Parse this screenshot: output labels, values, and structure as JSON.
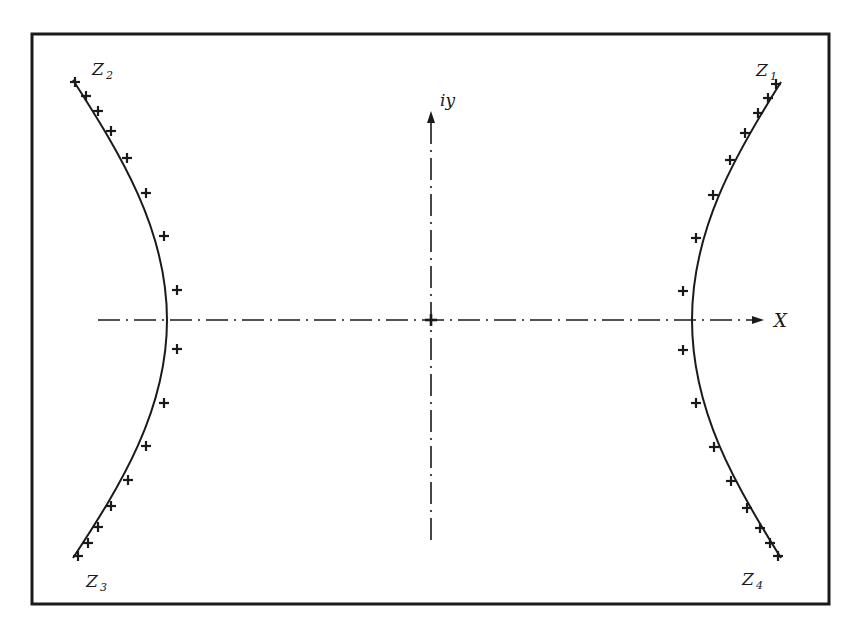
{
  "diagram": {
    "type": "hyperbola-root-locus",
    "frame": {
      "x": 31,
      "y": 33,
      "width": 798,
      "height": 571
    },
    "colors": {
      "ink": "#1a1a1a",
      "background": "#ffffff"
    },
    "axes": {
      "origin": {
        "x": 431,
        "y": 320
      },
      "x_axis": {
        "label": "X",
        "from": 98,
        "to": 764,
        "style": "dash-dot",
        "arrow": true
      },
      "y_axis": {
        "label": "iy",
        "from": 540,
        "to": 112,
        "style": "dash-dot",
        "arrow": true
      },
      "origin_marker": "+"
    },
    "branches": [
      {
        "name": "right",
        "vertex_x": 692,
        "top_label": "Z",
        "top_sub": "1",
        "bottom_label": "Z",
        "bottom_sub": "4"
      },
      {
        "name": "left",
        "vertex_x": 167,
        "top_label": "Z",
        "top_sub": "2",
        "bottom_label": "Z",
        "bottom_sub": "3"
      }
    ],
    "labels": {
      "z1": {
        "main": "Z",
        "sub": "1"
      },
      "z2": {
        "main": "Z",
        "sub": "2"
      },
      "z3": {
        "main": "Z",
        "sub": "3"
      },
      "z4": {
        "main": "Z",
        "sub": "4"
      },
      "x_axis": "X",
      "y_axis": "iy"
    },
    "markers": {
      "symbol": "+",
      "left": [
        [
          75,
          82
        ],
        [
          86,
          96
        ],
        [
          98,
          111
        ],
        [
          111,
          131
        ],
        [
          127,
          158
        ],
        [
          146,
          193
        ],
        [
          164,
          236
        ],
        [
          177,
          290
        ],
        [
          177,
          349
        ],
        [
          164,
          403
        ],
        [
          146,
          446
        ],
        [
          128,
          480
        ],
        [
          111,
          506
        ],
        [
          98,
          527
        ],
        [
          88,
          543
        ],
        [
          78,
          556
        ]
      ],
      "right": [
        [
          776,
          84
        ],
        [
          768,
          98
        ],
        [
          758,
          113
        ],
        [
          745,
          133
        ],
        [
          730,
          160
        ],
        [
          713,
          195
        ],
        [
          696,
          238
        ],
        [
          683,
          291
        ],
        [
          683,
          350
        ],
        [
          696,
          403
        ],
        [
          714,
          447
        ],
        [
          731,
          481
        ],
        [
          747,
          508
        ],
        [
          760,
          528
        ],
        [
          770,
          543
        ],
        [
          778,
          556
        ]
      ]
    }
  }
}
